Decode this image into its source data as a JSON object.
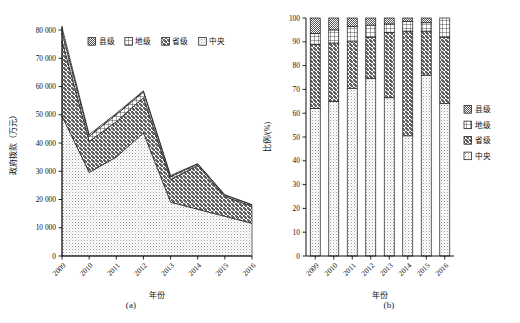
{
  "figure": {
    "panel_a_caption": "(a)",
    "panel_b_caption": "(b)"
  },
  "series_names": {
    "county": "县级",
    "prefecture": "地级",
    "province": "省级",
    "central": "中央"
  },
  "chart_data": [
    {
      "type": "area",
      "id": "panel-a",
      "title": "",
      "xlabel": "年份",
      "ylabel": "政府拨款（万元）",
      "categories": [
        "2009",
        "2010",
        "2011",
        "2012",
        "2013",
        "2014",
        "2015",
        "2016"
      ],
      "ylim": [
        0,
        80000
      ],
      "ytick_labels": [
        "0",
        "10 000",
        "20 000",
        "30 000",
        "40 000",
        "50 000",
        "60 000",
        "70 000",
        "80 000"
      ],
      "ytick_values": [
        0,
        10000,
        20000,
        30000,
        40000,
        50000,
        60000,
        70000,
        80000
      ],
      "grid": false,
      "stacked": true,
      "legend_position": "top-center",
      "legend_entries": [
        "县级",
        "地级",
        "省级",
        "中央"
      ],
      "series": [
        {
          "name": "中央",
          "values": [
            49500,
            29500,
            35000,
            43500,
            19000,
            16500,
            14000,
            11500
          ]
        },
        {
          "name": "省级",
          "values": [
            26500,
            11000,
            12500,
            12500,
            8000,
            15500,
            7000,
            6000
          ]
        },
        {
          "name": "地级",
          "values": [
            3000,
            1800,
            2500,
            2000,
            1000,
            500,
            500,
            500
          ]
        },
        {
          "name": "县级",
          "values": [
            2000,
            700,
            500,
            500,
            500,
            200,
            200,
            200
          ]
        }
      ],
      "stack_tops": [
        81000,
        43000,
        50500,
        58500,
        28500,
        32700,
        21700,
        18200
      ]
    },
    {
      "type": "bar",
      "id": "panel-b",
      "title": "",
      "xlabel": "年份",
      "ylabel": "比例/(%)",
      "categories": [
        "2009",
        "2010",
        "2011",
        "2012",
        "2013",
        "2014",
        "2015",
        "2016"
      ],
      "ylim": [
        0,
        100
      ],
      "ytick_labels": [
        "0",
        "10",
        "20",
        "30",
        "40",
        "50",
        "60",
        "70",
        "80",
        "90",
        "100"
      ],
      "ytick_values": [
        0,
        10,
        20,
        30,
        40,
        50,
        60,
        70,
        80,
        90,
        100
      ],
      "grid": false,
      "stacked": true,
      "normalized": true,
      "legend_position": "right",
      "legend_entries": [
        "县级",
        "地级",
        "省级",
        "中央"
      ],
      "series": [
        {
          "name": "中央",
          "values": [
            62.0,
            65.0,
            70.5,
            74.5,
            66.5,
            50.5,
            76.0,
            64.0
          ]
        },
        {
          "name": "省级",
          "values": [
            27.0,
            24.5,
            19.5,
            17.5,
            27.5,
            44.0,
            18.5,
            28.0
          ]
        },
        {
          "name": "地级",
          "values": [
            4.5,
            5.5,
            6.5,
            5.0,
            3.5,
            4.0,
            3.5,
            8.0
          ]
        },
        {
          "name": "县级",
          "values": [
            6.5,
            5.0,
            3.5,
            3.0,
            2.5,
            1.5,
            2.0,
            0.0
          ]
        }
      ],
      "segment_boundaries": [
        [
          62.0,
          89.0,
          93.5,
          100.0
        ],
        [
          65.0,
          89.5,
          95.0,
          100.0
        ],
        [
          70.5,
          90.0,
          96.5,
          100.0
        ],
        [
          74.5,
          92.0,
          97.0,
          100.0
        ],
        [
          66.5,
          94.0,
          97.5,
          100.0
        ],
        [
          50.5,
          94.5,
          98.5,
          100.0
        ],
        [
          76.0,
          94.5,
          98.0,
          100.0
        ],
        [
          64.0,
          92.0,
          100.0,
          100.0
        ]
      ]
    }
  ]
}
